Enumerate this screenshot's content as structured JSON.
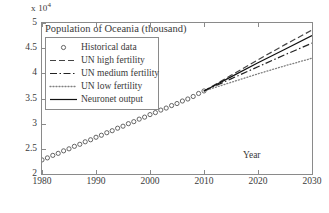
{
  "chart_data": {
    "type": "line",
    "title": "Population of Oceania (thousand)",
    "xlabel": "Year",
    "ylabel": "",
    "y_multiplier": "x 10",
    "y_multiplier_exponent": "4",
    "xlim": [
      1980,
      2030
    ],
    "ylim": [
      2,
      5
    ],
    "xticks": [
      1980,
      1990,
      2000,
      2010,
      2020,
      2030
    ],
    "yticks": [
      2,
      2.5,
      3,
      3.5,
      4,
      4.5,
      5
    ],
    "xtick_labels": [
      "1980",
      "1990",
      "2000",
      "2010",
      "2020",
      "2030"
    ],
    "ytick_labels": [
      "2",
      "2.5",
      "3",
      "3.5",
      "4",
      "4.5",
      "5"
    ],
    "grid": false,
    "legend_position": "upper-left",
    "series": [
      {
        "name": "Historical data",
        "style": "markers",
        "marker": "circle-open",
        "color": "#555555",
        "x": [
          1980,
          1981,
          1982,
          1983,
          1984,
          1985,
          1986,
          1987,
          1988,
          1989,
          1990,
          1991,
          1992,
          1993,
          1994,
          1995,
          1996,
          1997,
          1998,
          1999,
          2000,
          2001,
          2002,
          2003,
          2004,
          2005,
          2006,
          2007,
          2008,
          2009,
          2010
        ],
        "y": [
          2.28,
          2.32,
          2.37,
          2.41,
          2.46,
          2.5,
          2.55,
          2.59,
          2.64,
          2.68,
          2.73,
          2.77,
          2.82,
          2.86,
          2.91,
          2.95,
          3.0,
          3.04,
          3.09,
          3.13,
          3.18,
          3.22,
          3.27,
          3.31,
          3.36,
          3.4,
          3.45,
          3.49,
          3.54,
          3.6,
          3.65
        ]
      },
      {
        "name": "UN high fertility",
        "style": "dashed",
        "color": "#444444",
        "x": [
          2010,
          2015,
          2020,
          2025,
          2030
        ],
        "y": [
          3.65,
          3.96,
          4.27,
          4.57,
          4.86
        ]
      },
      {
        "name": "UN medium fertility",
        "style": "dash-dot",
        "color": "#222222",
        "x": [
          2010,
          2015,
          2020,
          2025,
          2030
        ],
        "y": [
          3.65,
          3.89,
          4.13,
          4.37,
          4.6
        ]
      },
      {
        "name": "UN low fertility",
        "style": "dotted",
        "color": "#808080",
        "x": [
          2010,
          2015,
          2020,
          2025,
          2030
        ],
        "y": [
          3.65,
          3.82,
          3.99,
          4.15,
          4.3
        ]
      },
      {
        "name": "Neuronet output",
        "style": "solid",
        "color": "#111111",
        "x": [
          2010,
          2015,
          2020,
          2025,
          2030
        ],
        "y": [
          3.65,
          3.93,
          4.21,
          4.48,
          4.75
        ]
      }
    ]
  }
}
